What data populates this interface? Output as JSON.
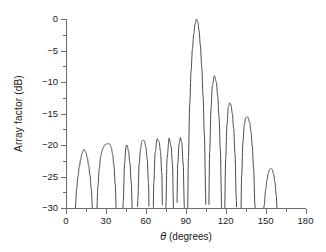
{
  "chart_data": {
    "type": "line",
    "title": "",
    "subtitle": "",
    "xlabel_theta": "θ",
    "xlabel_rest": " (degrees)",
    "xlabel": "θ (degrees)",
    "ylabel": "Array factor (dB)",
    "xlim": [
      0,
      180
    ],
    "ylim": [
      -30,
      0
    ],
    "xticks": [
      0,
      30,
      60,
      90,
      120,
      150,
      180
    ],
    "xtick_labels": [
      "0",
      "30",
      "60",
      "90",
      "120",
      "150",
      "180"
    ],
    "xminor_interval": 15,
    "yticks": [
      0,
      -5,
      -10,
      -15,
      -20,
      -25,
      -30
    ],
    "ytick_labels": [
      "0",
      "−5",
      "−10",
      "−15",
      "−20",
      "−25",
      "−30"
    ],
    "yminor_interval": 2.5,
    "grid": false,
    "legend": null,
    "line_color": "#4a4a4a",
    "line_width": 1,
    "background": "#ffffff",
    "axis_color": "#6d6d6d",
    "text_color": "#1a1a1a",
    "frame": "left-bottom",
    "clip_floor_db": -30,
    "main_lobe": {
      "peak_theta": 98,
      "peak_db": 0,
      "left_null_theta": 90.5,
      "right_null_theta": 105.5
    },
    "sidelobe_peaks": [
      {
        "theta": 13.5,
        "db": -20.7
      },
      {
        "theta": 32.5,
        "db": -19.8
      },
      {
        "theta": 45.5,
        "db": -20.0
      },
      {
        "theta": 58.0,
        "db": -19.2
      },
      {
        "theta": 68.5,
        "db": -19.0
      },
      {
        "theta": 77.5,
        "db": -18.9
      },
      {
        "theta": 86.0,
        "db": -18.8
      },
      {
        "theta": 111.5,
        "db": -9.0
      },
      {
        "theta": 123.0,
        "db": -13.3
      },
      {
        "theta": 136.5,
        "db": -15.5
      },
      {
        "theta": 154.0,
        "db": -23.7
      }
    ],
    "nulls_theta": [
      4.0,
      21.5,
      26.5,
      39.5,
      41.5,
      51.0,
      52.5,
      63.0,
      64.5,
      73.0,
      74.0,
      81.5,
      82.5,
      90.5,
      105.5,
      106.5,
      117.5,
      118.5,
      129.5,
      130.5,
      143.5,
      146.0,
      161.5
    ],
    "x": [
      0.0,
      1.0,
      2.0,
      3.0,
      4.0,
      5.0,
      6.0,
      7.0,
      8.0,
      9.0,
      10.0,
      11.0,
      12.0,
      13.0,
      13.5,
      14.0,
      15.0,
      16.0,
      17.0,
      18.0,
      19.0,
      20.0,
      21.0,
      21.5,
      22.0,
      23.0,
      24.0,
      25.0,
      26.0,
      26.5,
      27.0,
      28.0,
      29.0,
      30.0,
      31.0,
      32.0,
      32.5,
      33.0,
      34.0,
      35.0,
      36.0,
      37.0,
      38.0,
      39.0,
      39.5,
      40.0,
      40.5,
      41.0,
      41.5,
      42.0,
      43.0,
      44.0,
      45.0,
      45.5,
      46.0,
      47.0,
      48.0,
      49.0,
      50.0,
      51.0,
      51.5,
      52.0,
      52.5,
      53.0,
      54.0,
      55.0,
      56.0,
      57.0,
      58.0,
      59.0,
      60.0,
      61.0,
      62.0,
      63.0,
      63.7,
      64.5,
      65.0,
      66.0,
      67.0,
      68.5,
      70.0,
      71.0,
      72.0,
      73.0,
      73.5,
      74.0,
      75.0,
      76.0,
      77.5,
      79.0,
      80.0,
      81.0,
      81.5,
      82.0,
      82.5,
      83.0,
      84.0,
      85.0,
      86.0,
      87.0,
      88.0,
      89.0,
      90.0,
      90.5,
      91.0,
      92.0,
      93.0,
      94.0,
      95.0,
      96.0,
      97.0,
      98.0,
      99.0,
      100.0,
      101.0,
      102.0,
      103.0,
      104.0,
      105.0,
      105.5,
      106.0,
      106.5,
      107.0,
      108.0,
      109.0,
      110.0,
      111.5,
      113.0,
      114.0,
      115.0,
      116.0,
      117.0,
      117.5,
      118.0,
      118.5,
      119.0,
      120.0,
      121.0,
      122.0,
      123.0,
      124.0,
      125.0,
      126.0,
      127.0,
      128.0,
      129.0,
      129.5,
      130.0,
      130.5,
      131.0,
      132.0,
      133.0,
      134.0,
      135.0,
      136.5,
      138.0,
      139.0,
      140.0,
      141.0,
      142.0,
      143.0,
      143.5,
      144.0,
      145.0,
      146.0,
      147.0,
      148.0,
      149.0,
      150.0,
      151.0,
      152.0,
      153.0,
      154.0,
      155.0,
      156.0,
      157.0,
      158.0,
      159.0,
      160.0,
      161.0,
      161.5,
      162.0,
      163.0
    ],
    "y": [
      -60.0,
      -55.0,
      -48.0,
      -40.0,
      -60.0,
      -42.0,
      -34.0,
      -30.0,
      -27.0,
      -25.0,
      -23.5,
      -22.3,
      -21.4,
      -20.9,
      -20.7,
      -20.8,
      -21.2,
      -22.0,
      -23.2,
      -24.8,
      -27.0,
      -30.5,
      -38.0,
      -60.0,
      -40.0,
      -31.0,
      -26.5,
      -23.8,
      -21.9,
      -21.4,
      -21.0,
      -20.4,
      -20.0,
      -19.9,
      -19.8,
      -19.8,
      -19.8,
      -19.9,
      -20.4,
      -21.4,
      -23.2,
      -26.2,
      -32.0,
      -45.0,
      -60.0,
      -44.0,
      -52.0,
      -40.0,
      -60.0,
      -40.0,
      -29.0,
      -23.0,
      -20.4,
      -20.0,
      -20.1,
      -21.0,
      -22.8,
      -25.8,
      -31.5,
      -45.0,
      -60.0,
      -46.0,
      -60.0,
      -42.0,
      -28.5,
      -23.0,
      -20.6,
      -19.4,
      -19.2,
      -19.4,
      -20.3,
      -22.2,
      -26.0,
      -40.0,
      -60.0,
      -60.0,
      -40.0,
      -26.0,
      -21.2,
      -19.0,
      -19.5,
      -21.0,
      -24.5,
      -40.0,
      -60.0,
      -60.0,
      -30.0,
      -22.0,
      -18.9,
      -20.2,
      -23.0,
      -32.0,
      -60.0,
      -34.0,
      -60.0,
      -34.0,
      -23.0,
      -19.8,
      -18.8,
      -19.6,
      -22.8,
      -30.0,
      -44.0,
      -60.0,
      -40.0,
      -22.0,
      -13.5,
      -8.3,
      -4.8,
      -2.4,
      -0.8,
      0.0,
      -0.4,
      -1.8,
      -4.2,
      -7.6,
      -12.2,
      -18.4,
      -28.0,
      -60.0,
      -36.0,
      -60.0,
      -35.0,
      -21.0,
      -14.2,
      -10.6,
      -9.0,
      -10.0,
      -12.2,
      -15.6,
      -20.8,
      -30.0,
      -60.0,
      -38.0,
      -60.0,
      -34.0,
      -22.2,
      -16.8,
      -14.0,
      -13.3,
      -13.6,
      -15.0,
      -17.4,
      -21.4,
      -28.5,
      -44.0,
      -60.0,
      -46.0,
      -60.0,
      -40.0,
      -25.0,
      -19.5,
      -16.8,
      -15.7,
      -15.5,
      -16.4,
      -17.8,
      -20.2,
      -23.8,
      -29.5,
      -40.0,
      -60.0,
      -48.0,
      -38.0,
      -60.0,
      -40.0,
      -33.0,
      -29.5,
      -27.2,
      -25.6,
      -24.5,
      -23.9,
      -23.7,
      -23.9,
      -24.6,
      -25.9,
      -28.0,
      -31.5,
      -38.0,
      -50.0,
      -60.0,
      -50.0,
      -42.0
    ]
  }
}
